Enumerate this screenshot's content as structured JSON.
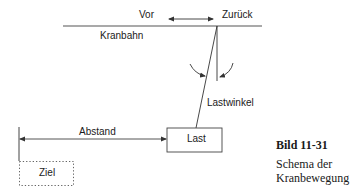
{
  "diagram": {
    "labels": {
      "forward": "Vor",
      "backward": "Zurück",
      "track": "Kranbahn",
      "load_angle": "Lastwinkel",
      "distance": "Abstand",
      "load": "Last",
      "target": "Ziel"
    },
    "colors": {
      "stroke": "#444444",
      "text": "#1a1a1a"
    }
  },
  "caption": {
    "figure_number": "Bild 11-31",
    "line1": "Schema der",
    "line2": "Kranbewegung"
  }
}
